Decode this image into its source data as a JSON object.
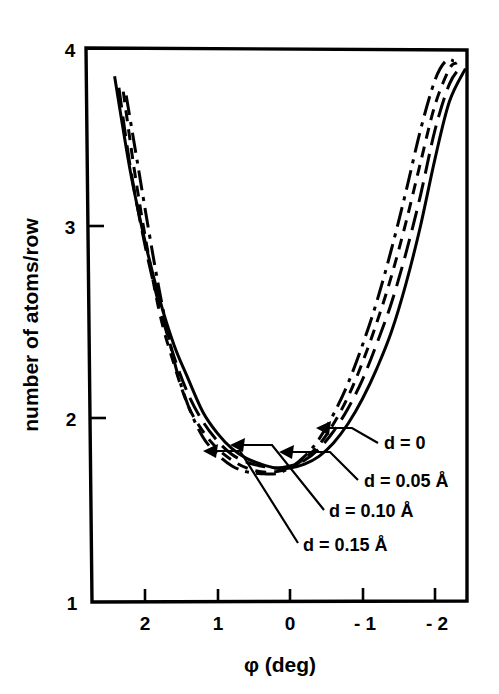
{
  "chart_data": {
    "type": "line",
    "title": "",
    "xlabel": "φ  (deg)",
    "ylabel": "number of atoms/row",
    "xlim": [
      2.5,
      -2.5
    ],
    "ylim": [
      1,
      4
    ],
    "x_ticks": [
      "2",
      "1",
      "0",
      "-1",
      "-2"
    ],
    "x_tick_values": [
      2,
      1,
      0,
      -1,
      -2
    ],
    "y_ticks": [
      "1",
      "2",
      "3",
      "4"
    ],
    "y_tick_values": [
      1,
      2,
      3,
      4
    ],
    "x_axis_reversed": true,
    "grid": false,
    "legend": "inline-annotations",
    "series": [
      {
        "name": "d = 0",
        "label": "d = 0",
        "style": "solid",
        "x": [
          2.42,
          2.2,
          2.0,
          1.8,
          1.6,
          1.4,
          1.2,
          1.0,
          0.8,
          0.6,
          0.4,
          0.2,
          0.0,
          -0.2,
          -0.4,
          -0.6,
          -0.8,
          -1.0,
          -1.2,
          -1.4,
          -1.6,
          -1.8,
          -2.0,
          -2.2,
          -2.42
        ],
        "y": [
          3.78,
          3.28,
          2.92,
          2.62,
          2.38,
          2.2,
          2.03,
          1.92,
          1.84,
          1.79,
          1.76,
          1.74,
          1.74,
          1.76,
          1.8,
          1.87,
          1.97,
          2.1,
          2.26,
          2.45,
          2.7,
          3.0,
          3.35,
          3.65,
          3.82
        ]
      },
      {
        "name": "d = 0.05 A",
        "label": "d = 0.05 Å",
        "style": "long-dash",
        "x": [
          2.36,
          2.2,
          2.0,
          1.8,
          1.6,
          1.4,
          1.2,
          1.0,
          0.8,
          0.6,
          0.4,
          0.2,
          0.0,
          -0.2,
          -0.4,
          -0.6,
          -0.8,
          -1.0,
          -1.2,
          -1.4,
          -1.6,
          -1.8,
          -2.0,
          -2.2,
          -2.36
        ],
        "y": [
          3.72,
          3.3,
          2.9,
          2.58,
          2.32,
          2.12,
          1.98,
          1.88,
          1.81,
          1.77,
          1.75,
          1.74,
          1.75,
          1.78,
          1.84,
          1.93,
          2.05,
          2.2,
          2.39,
          2.6,
          2.86,
          3.16,
          3.5,
          3.74,
          3.83
        ]
      },
      {
        "name": "d = 0.10 A",
        "label": "d = 0.10 Å",
        "style": "short-dash",
        "x": [
          2.3,
          2.15,
          2.0,
          1.8,
          1.6,
          1.4,
          1.2,
          1.0,
          0.8,
          0.6,
          0.4,
          0.2,
          0.0,
          -0.2,
          -0.4,
          -0.6,
          -0.8,
          -1.0,
          -1.2,
          -1.4,
          -1.6,
          -1.8,
          -2.0,
          -2.2,
          -2.3
        ],
        "y": [
          3.7,
          3.3,
          2.95,
          2.55,
          2.28,
          2.06,
          1.93,
          1.84,
          1.78,
          1.74,
          1.72,
          1.72,
          1.74,
          1.79,
          1.86,
          1.97,
          2.11,
          2.29,
          2.5,
          2.74,
          3.02,
          3.33,
          3.63,
          3.82,
          3.85
        ]
      },
      {
        "name": "d = 0.15 A",
        "label": "d = 0.15 Å",
        "style": "dash-dot",
        "x": [
          2.26,
          2.1,
          1.95,
          1.8,
          1.6,
          1.4,
          1.2,
          1.0,
          0.8,
          0.6,
          0.4,
          0.2,
          0.0,
          -0.2,
          -0.4,
          -0.6,
          -0.8,
          -1.0,
          -1.2,
          -1.4,
          -1.6,
          -1.8,
          -2.0,
          -2.15,
          -2.26
        ],
        "y": [
          3.68,
          3.32,
          2.98,
          2.66,
          2.3,
          2.06,
          1.9,
          1.81,
          1.75,
          1.72,
          1.71,
          1.71,
          1.74,
          1.8,
          1.89,
          2.02,
          2.18,
          2.38,
          2.61,
          2.88,
          3.18,
          3.5,
          3.76,
          3.86,
          3.86
        ]
      }
    ],
    "annotations": [
      {
        "text": "d = 0",
        "label_x": 384,
        "label_y": 449,
        "leader": "M 378 443 L 352 428 L 318 428",
        "arrow_x": 316,
        "arrow_y": 428,
        "arrow_dir": "left"
      },
      {
        "text": "d = 0.05 Å",
        "label_x": 364,
        "label_y": 487,
        "leader": "M 358 480 L 330 452 L 281 452",
        "arrow_x": 279,
        "arrow_y": 452,
        "arrow_dir": "left"
      },
      {
        "text": "d = 0.10 Å",
        "label_x": 329,
        "label_y": 517,
        "leader": "M 324 510 L 272 445 L 232 445",
        "arrow_x": 230,
        "arrow_y": 445,
        "arrow_dir": "left"
      },
      {
        "text": "d = 0.15 Å",
        "label_x": 303,
        "label_y": 551,
        "leader": "M 298 543 L 240 451 L 205 451",
        "arrow_x": 203,
        "arrow_y": 451,
        "arrow_dir": "left"
      }
    ]
  },
  "axes": {
    "y_axis_title": "number of atoms/row",
    "x_axis_title": "φ  (deg)",
    "y_tick_labels": [
      "4",
      "3",
      "2",
      "1"
    ],
    "x_tick_labels": [
      "2",
      "1",
      "0",
      "- 1",
      "- 2"
    ]
  }
}
